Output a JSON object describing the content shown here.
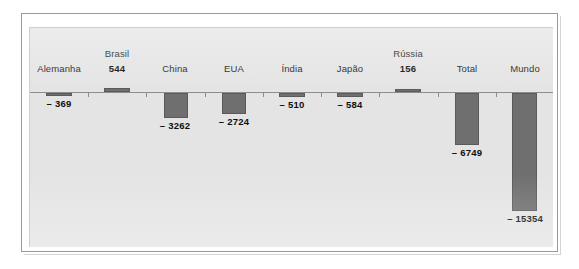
{
  "chart_data": {
    "type": "bar",
    "title": "",
    "subtitle": "",
    "xlabel": "",
    "ylabel": "",
    "grid": false,
    "legend": null,
    "orientation": "vertical",
    "baseline": 0,
    "ylim": [
      -16500,
      1200
    ],
    "categories": [
      "Alemanha",
      "Brasil",
      "China",
      "EUA",
      "Índia",
      "Japão",
      "Rússia",
      "Total",
      "Mundo"
    ],
    "values": [
      -369,
      544,
      -3262,
      -2724,
      -510,
      -584,
      156,
      -6749,
      -15354
    ],
    "value_labels": [
      "– 369",
      "544",
      "– 3262",
      "– 2724",
      "– 510",
      "– 584",
      "156",
      "– 6749",
      "– 15354"
    ],
    "series": [
      {
        "name": "",
        "values": [
          -369,
          544,
          -3262,
          -2724,
          -510,
          -584,
          156,
          -6749,
          -15354
        ]
      }
    ],
    "colors": {
      "bar": "#6f6f6f",
      "bar_edge": "#5a5a5a",
      "panel_background": "#e4e4e4",
      "figure_background": "#ffffff",
      "axis_line": "#8d8d8d",
      "frame": "#9a9a9a",
      "text": "#1e1e1e"
    }
  },
  "bars": [
    {
      "id": "alemanha",
      "category": "Alemanha",
      "value": -369,
      "value_label": "– 369",
      "label_above": "Alemanha",
      "label_stacked": null,
      "sign": "negative"
    },
    {
      "id": "brasil",
      "category": "Brasil",
      "value": 544,
      "value_label": "544",
      "label_above": "Brasil",
      "label_stacked": "544",
      "sign": "positive"
    },
    {
      "id": "china",
      "category": "China",
      "value": -3262,
      "value_label": "– 3262",
      "label_above": "China",
      "label_stacked": null,
      "sign": "negative"
    },
    {
      "id": "eua",
      "category": "EUA",
      "value": -2724,
      "value_label": "– 2724",
      "label_above": "EUA",
      "label_stacked": null,
      "sign": "negative"
    },
    {
      "id": "india",
      "category": "Índia",
      "value": -510,
      "value_label": "– 510",
      "label_above": "Índia",
      "label_stacked": null,
      "sign": "negative"
    },
    {
      "id": "japao",
      "category": "Japão",
      "value": -584,
      "value_label": "– 584",
      "label_above": "Japão",
      "label_stacked": null,
      "sign": "negative"
    },
    {
      "id": "russia",
      "category": "Rússia",
      "value": 156,
      "value_label": "156",
      "label_above": "Rússia",
      "label_stacked": "156",
      "sign": "positive"
    },
    {
      "id": "total",
      "category": "Total",
      "value": -6749,
      "value_label": "– 6749",
      "label_above": "Total",
      "label_stacked": null,
      "sign": "negative"
    },
    {
      "id": "mundo",
      "category": "Mundo",
      "value": -15354,
      "value_label": "– 15354",
      "label_above": "Mundo",
      "label_stacked": null,
      "sign": "negative"
    }
  ]
}
